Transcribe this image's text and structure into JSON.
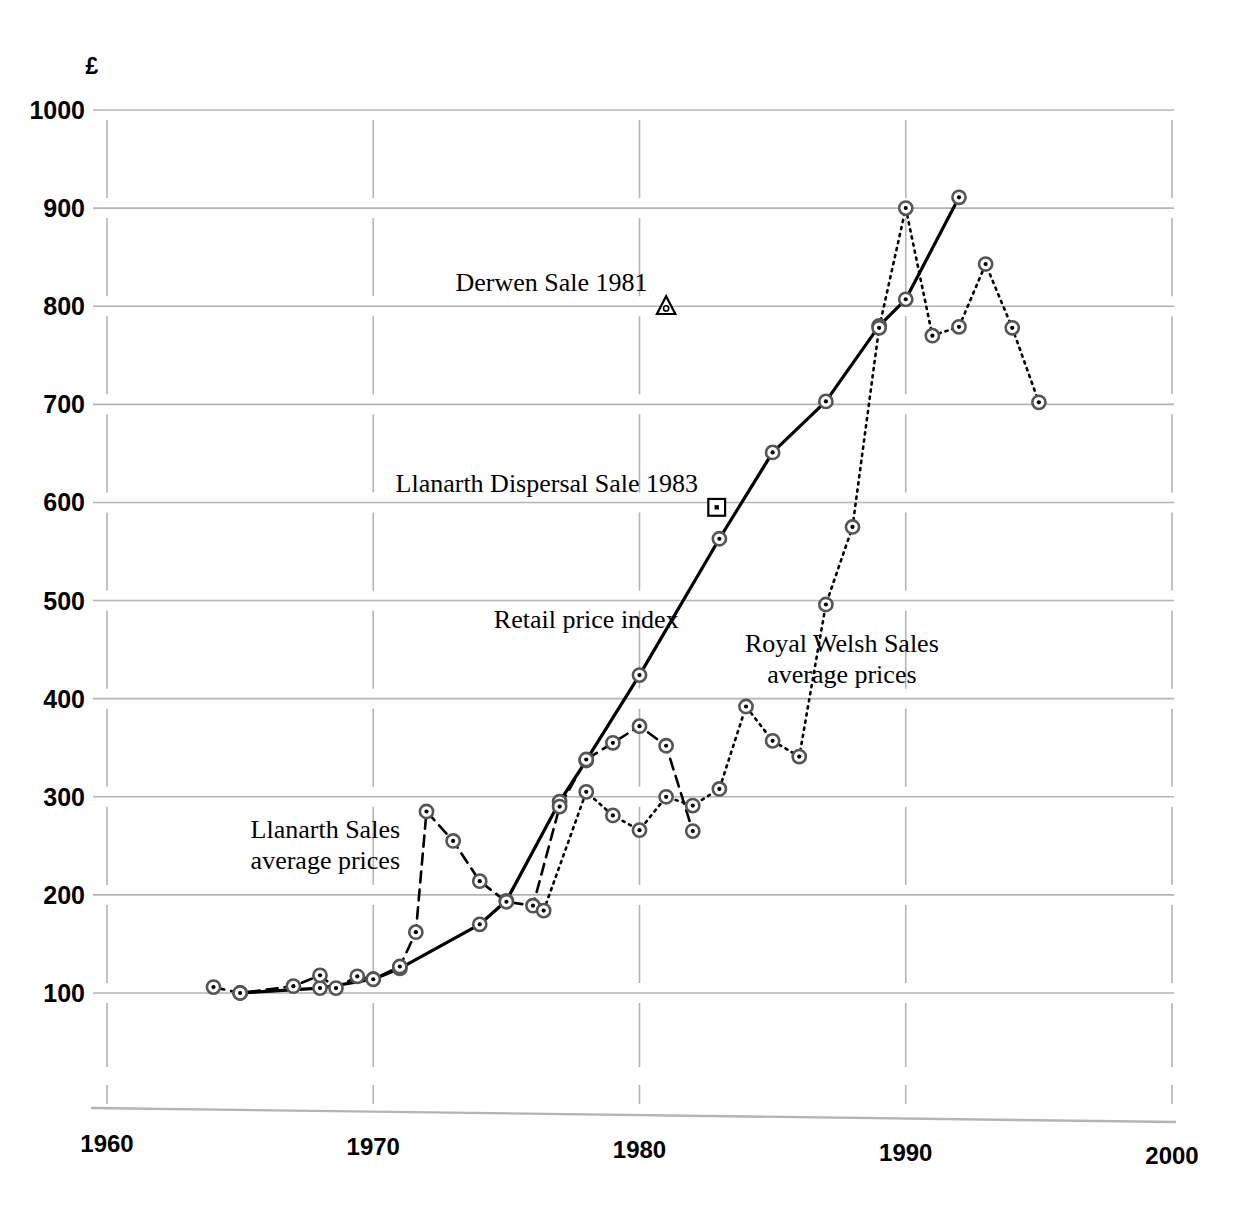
{
  "chart_data": {
    "type": "line",
    "title": "",
    "xlabel": "",
    "ylabel": "£",
    "currency_symbol": "£",
    "xlim": [
      1960,
      2000
    ],
    "ylim": [
      100,
      1000
    ],
    "xticks": [
      1960,
      1970,
      1980,
      1990,
      2000
    ],
    "yticks": [
      100,
      200,
      300,
      400,
      500,
      600,
      700,
      800,
      900,
      1000
    ],
    "grid": "horizontal gridlines at each 100; vertical decade gridlines",
    "legend": "inline labels on plot",
    "colors": {
      "ink": "#000000",
      "grid": "#b4b4b4"
    },
    "series": [
      {
        "name": "Retail price index",
        "style": "solid",
        "marker": "bullseye-circle",
        "label_position": {
          "x": 1978.0,
          "y": 472
        },
        "points": [
          {
            "x": 1965,
            "y": 100
          },
          {
            "x": 1968,
            "y": 105
          },
          {
            "x": 1970,
            "y": 114
          },
          {
            "x": 1971,
            "y": 125
          },
          {
            "x": 1974,
            "y": 170
          },
          {
            "x": 1975,
            "y": 194
          },
          {
            "x": 1977,
            "y": 295
          },
          {
            "x": 1978,
            "y": 337
          },
          {
            "x": 1980,
            "y": 424
          },
          {
            "x": 1983,
            "y": 563
          },
          {
            "x": 1985,
            "y": 651
          },
          {
            "x": 1987,
            "y": 703
          },
          {
            "x": 1989,
            "y": 780
          },
          {
            "x": 1990,
            "y": 807
          },
          {
            "x": 1992,
            "y": 911
          }
        ]
      },
      {
        "name": "Llanarth Sales average prices",
        "style": "dashed",
        "marker": "bullseye-circle",
        "label_line1": "Llanarth Sales",
        "label_line2": "average prices",
        "label_position": {
          "x": 1968.2,
          "y": 258
        },
        "points": [
          {
            "x": 1964,
            "y": 106
          },
          {
            "x": 1965,
            "y": 100
          },
          {
            "x": 1967,
            "y": 107
          },
          {
            "x": 1968,
            "y": 118
          },
          {
            "x": 1968.6,
            "y": 105
          },
          {
            "x": 1969.4,
            "y": 117
          },
          {
            "x": 1970,
            "y": 114
          },
          {
            "x": 1971,
            "y": 127
          },
          {
            "x": 1971.6,
            "y": 162
          },
          {
            "x": 1972,
            "y": 285
          },
          {
            "x": 1973,
            "y": 255
          },
          {
            "x": 1974,
            "y": 214
          },
          {
            "x": 1975,
            "y": 193
          },
          {
            "x": 1976,
            "y": 189
          },
          {
            "x": 1977,
            "y": 290
          },
          {
            "x": 1978,
            "y": 338
          },
          {
            "x": 1979,
            "y": 355
          },
          {
            "x": 1980,
            "y": 372
          },
          {
            "x": 1981,
            "y": 352
          },
          {
            "x": 1982,
            "y": 265
          }
        ]
      },
      {
        "name": "Royal Welsh Sales average prices",
        "style": "dotted",
        "marker": "bullseye-circle",
        "label_line1": "Royal Welsh Sales",
        "label_line2": "average prices",
        "label_position": {
          "x": 1987.6,
          "y": 448
        },
        "points": [
          {
            "x": 1976.4,
            "y": 184
          },
          {
            "x": 1978,
            "y": 305
          },
          {
            "x": 1979,
            "y": 281
          },
          {
            "x": 1980,
            "y": 266
          },
          {
            "x": 1981,
            "y": 300
          },
          {
            "x": 1982,
            "y": 291
          },
          {
            "x": 1983,
            "y": 308
          },
          {
            "x": 1984,
            "y": 392
          },
          {
            "x": 1985,
            "y": 357
          },
          {
            "x": 1986,
            "y": 341
          },
          {
            "x": 1987,
            "y": 496
          },
          {
            "x": 1988,
            "y": 575
          },
          {
            "x": 1989,
            "y": 778
          },
          {
            "x": 1990,
            "y": 900
          },
          {
            "x": 1991,
            "y": 770
          },
          {
            "x": 1992,
            "y": 779
          },
          {
            "x": 1993,
            "y": 843
          },
          {
            "x": 1994,
            "y": 778
          },
          {
            "x": 1995,
            "y": 702
          }
        ]
      }
    ],
    "annotations": [
      {
        "text": "Derwen Sale 1981",
        "marker": "triangle",
        "point": {
          "x": 1981.0,
          "y": 800
        },
        "text_anchor_end": {
          "x": 1980.3,
          "y": 816
        }
      },
      {
        "text": "Llanarth Dispersal Sale 1983",
        "marker": "square",
        "point": {
          "x": 1982.9,
          "y": 595
        },
        "text_anchor_end": {
          "x": 1982.2,
          "y": 611
        }
      }
    ]
  }
}
